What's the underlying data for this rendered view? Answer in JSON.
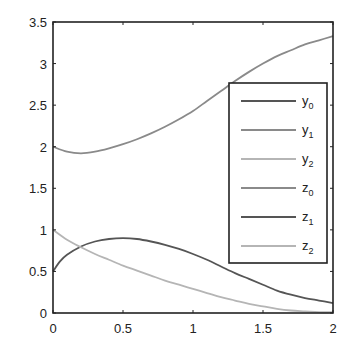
{
  "chart_data": {
    "type": "line",
    "title": "",
    "xlabel": "",
    "ylabel": "",
    "xlim": [
      0,
      2
    ],
    "ylim": [
      0,
      3.5
    ],
    "grid": false,
    "x_ticks": [
      "0",
      "0.5",
      "1",
      "1.5",
      "2"
    ],
    "y_ticks": [
      "0",
      "0.5",
      "1",
      "1.5",
      "2",
      "2.5",
      "3",
      "3.5"
    ],
    "legend_position": "inside right",
    "legend": [
      {
        "base": "y",
        "sub": "0",
        "color": "#555555"
      },
      {
        "base": "y",
        "sub": "1",
        "color": "#8a8a8a"
      },
      {
        "base": "y",
        "sub": "2",
        "color": "#b5b5b5"
      },
      {
        "base": "z",
        "sub": "0",
        "color": "#8a8a8a"
      },
      {
        "base": "z",
        "sub": "1",
        "color": "#555555"
      },
      {
        "base": "z",
        "sub": "2",
        "color": "#b5b5b5"
      }
    ],
    "series": [
      {
        "name": "y1",
        "color": "#8a8a8a",
        "x": [
          0,
          0.1,
          0.2,
          0.3,
          0.4,
          0.5,
          0.6,
          0.7,
          0.8,
          0.9,
          1.0,
          1.1,
          1.2,
          1.3,
          1.4,
          1.5,
          1.6,
          1.7,
          1.8,
          1.9,
          2.0
        ],
        "values": [
          2.0,
          1.94,
          1.92,
          1.94,
          1.98,
          2.03,
          2.09,
          2.16,
          2.24,
          2.33,
          2.43,
          2.55,
          2.67,
          2.79,
          2.9,
          3.0,
          3.09,
          3.16,
          3.23,
          3.28,
          3.33
        ]
      },
      {
        "name": "z1",
        "color": "#555555",
        "x": [
          0,
          0.05,
          0.1,
          0.2,
          0.3,
          0.4,
          0.5,
          0.6,
          0.7,
          0.8,
          0.9,
          1.0,
          1.1,
          1.2,
          1.3,
          1.4,
          1.5,
          1.6,
          1.7,
          1.8,
          1.9,
          2.0
        ],
        "values": [
          0.5,
          0.62,
          0.7,
          0.8,
          0.86,
          0.89,
          0.9,
          0.89,
          0.86,
          0.82,
          0.77,
          0.71,
          0.64,
          0.56,
          0.48,
          0.41,
          0.34,
          0.27,
          0.22,
          0.18,
          0.15,
          0.12
        ]
      },
      {
        "name": "z2",
        "color": "#b5b5b5",
        "x": [
          0,
          0.1,
          0.2,
          0.3,
          0.4,
          0.5,
          0.6,
          0.7,
          0.8,
          0.9,
          1.0,
          1.1,
          1.2,
          1.3,
          1.4,
          1.5,
          1.6,
          1.7,
          1.8,
          1.9,
          2.0
        ],
        "values": [
          1.0,
          0.88,
          0.79,
          0.71,
          0.64,
          0.57,
          0.51,
          0.45,
          0.39,
          0.34,
          0.29,
          0.24,
          0.19,
          0.15,
          0.11,
          0.08,
          0.05,
          0.03,
          0.02,
          0.01,
          0.01
        ]
      }
    ]
  }
}
